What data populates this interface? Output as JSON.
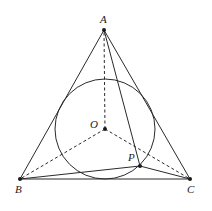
{
  "diagram": {
    "points": {
      "A": {
        "label": "A",
        "x": 104,
        "y": 30
      },
      "B": {
        "label": "B",
        "x": 20,
        "y": 179
      },
      "C": {
        "label": "C",
        "x": 190,
        "y": 179
      },
      "O": {
        "label": "O",
        "x": 105,
        "y": 129
      },
      "P": {
        "label": "P",
        "x": 140,
        "y": 166
      }
    },
    "circle": {
      "center": "O",
      "cx": 105,
      "cy": 129,
      "r": 50
    },
    "solid_segments": [
      [
        "A",
        "B"
      ],
      [
        "B",
        "C"
      ],
      [
        "C",
        "A"
      ],
      [
        "P",
        "A"
      ],
      [
        "P",
        "B"
      ],
      [
        "P",
        "C"
      ]
    ],
    "dashed_segments": [
      [
        "O",
        "A"
      ],
      [
        "O",
        "B"
      ],
      [
        "O",
        "C"
      ]
    ],
    "colors": {
      "stroke": "#2a2a2a",
      "background": "#ffffff"
    }
  }
}
